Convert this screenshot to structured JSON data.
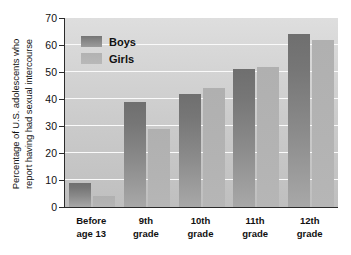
{
  "chart_data": {
    "type": "bar",
    "title": "",
    "subtitle": "",
    "xlabel": "",
    "ylabel_line1": "Percentage of U.S. adolescents who",
    "ylabel_line2": "report having had sexual intercourse",
    "categories": [
      {
        "line1": "Before",
        "line2": "age 13"
      },
      {
        "line1": "9th",
        "line2": "grade"
      },
      {
        "line1": "10th",
        "line2": "grade"
      },
      {
        "line1": "11th",
        "line2": "grade"
      },
      {
        "line1": "12th",
        "line2": "grade"
      }
    ],
    "series": [
      {
        "name": "Boys",
        "color": "#8a8a8a",
        "values": [
          9,
          39,
          42,
          51,
          64
        ]
      },
      {
        "name": "Girls",
        "color": "#b3b3b3",
        "values": [
          4,
          29,
          44,
          52,
          62
        ]
      }
    ],
    "ylim": [
      0,
      70
    ],
    "ytick_values": [
      0,
      10,
      20,
      30,
      40,
      50,
      60,
      70
    ],
    "ytick_labels": [
      "0",
      "10",
      "20",
      "30",
      "40",
      "50",
      "60",
      "70"
    ],
    "grid": true,
    "grid_color": "#fafafa",
    "legend_position": "top-left",
    "legend_entries": [
      "Boys",
      "Girls"
    ],
    "plot_background": "#d4d4d4",
    "axis_color": "#2b2b2b"
  }
}
